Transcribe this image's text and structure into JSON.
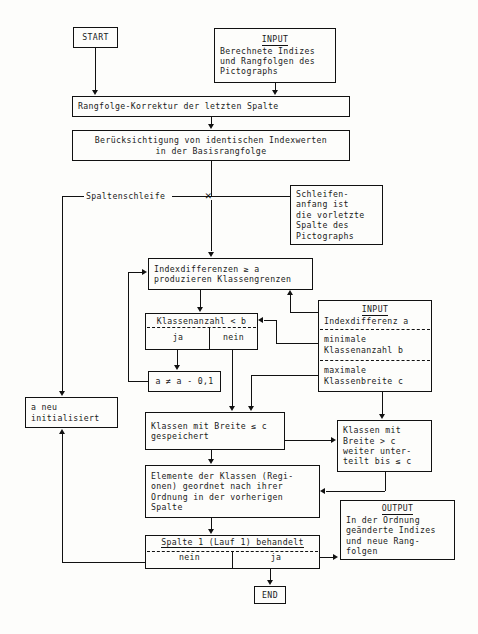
{
  "diagram": {
    "language": "de"
  },
  "nodes": {
    "start": {
      "label": "START"
    },
    "input_top": {
      "heading": "INPUT",
      "line1": "Berechnete Indizes",
      "line2": "und Rangfolgen des",
      "line3": "Pictographs"
    },
    "rangfolge_korrektur": {
      "line1": "Rangfolge-Korrektur der letzten Spalte"
    },
    "beruecksichtigung": {
      "line1": "Berücksichtigung von identischen Indexwerten",
      "line2": "in der Basisrangfolge"
    },
    "spaltenschleife": {
      "label": "Spaltenschleife"
    },
    "schleifenanfang": {
      "line1": "Schleifen-",
      "line2": "anfang ist",
      "line3": "die vorletzte",
      "line4": "Spalte des",
      "line5": "Pictographs"
    },
    "indexdifferenzen": {
      "line1": "Indexdifferenzen ≥ a",
      "line2": "produzieren Klassengrenzen"
    },
    "klassenanzahl": {
      "condition": "Klassenanzahl < b",
      "branch_yes": "ja",
      "branch_no": "nein"
    },
    "a_dekrement": {
      "label": "a ≠ a - 0,1"
    },
    "input_right": {
      "heading": "INPUT",
      "sec1_line1": "Indexdifferenz a",
      "sec2_line1": "minimale",
      "sec2_line2": "Klassenanzahl b",
      "sec3_line1": "maximale",
      "sec3_line2": "Klassenbreite c"
    },
    "a_neu": {
      "line1": "a neu",
      "line2": "initialisiert"
    },
    "klassen_gespeichert": {
      "line1": "Klassen mit Breite ≤ c",
      "line2": "gespeichert"
    },
    "klassen_breiter": {
      "line1": "Klassen mit",
      "line2": "Breite > c",
      "line3": "weiter unter-",
      "line4": "teilt bis ≤ c"
    },
    "elemente": {
      "line1": "Elemente der Klassen (Regi-",
      "line2": "onen) geordnet nach ihrer",
      "line3": "Ordnung in der vorherigen",
      "line4": "Spalte"
    },
    "spalte_behandelt": {
      "condition": "Spalte 1 (Lauf 1) behandelt",
      "branch_no": "nein",
      "branch_yes": "ja"
    },
    "output": {
      "heading": "OUTPUT",
      "line1": "In der Ordnung",
      "line2": "geänderte Indizes",
      "line3": "und neue Rang-",
      "line4": "folgen"
    },
    "end": {
      "label": "END"
    }
  },
  "glyphs": {
    "junction_mark": "✕"
  },
  "colors": {
    "stroke": "#111111",
    "background": "#fdfdfb",
    "text": "#1a1a1a"
  }
}
